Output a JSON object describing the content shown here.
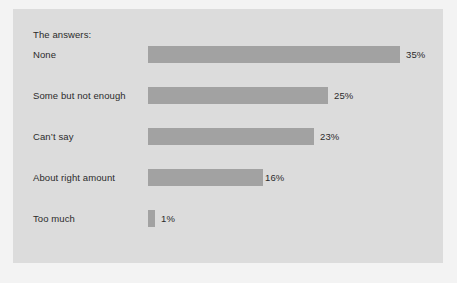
{
  "chart_data": {
    "type": "bar",
    "orientation": "horizontal",
    "title": "The answers:",
    "xlabel": "",
    "ylabel": "",
    "grid": false,
    "legend": null,
    "xlim": [
      0,
      35
    ],
    "value_suffix": "%",
    "categories": [
      "None",
      "Some but not enough",
      "Can’t say",
      "About right amount",
      "Too much"
    ],
    "values": [
      35,
      25,
      23,
      16,
      1
    ],
    "data_labels": [
      "35%",
      "25%",
      "23%",
      "16%",
      "1%"
    ],
    "bars": [
      {
        "label": "None",
        "value": 35,
        "data_label": "35%"
      },
      {
        "label": "Some but not enough",
        "value": 25,
        "data_label": "25%"
      },
      {
        "label": "Can’t say",
        "value": 23,
        "data_label": "23%"
      },
      {
        "label": "About right amount",
        "value": 16,
        "data_label": "16%"
      },
      {
        "label": "Too much",
        "value": 1,
        "data_label": "1%"
      }
    ]
  },
  "style": {
    "panel_background": "#dcdcdc",
    "figure_background": "#f3f3f3",
    "bar_color": "#a2a2a2",
    "text_color": "#2b2b2b",
    "pixels_per_percent": 7.2,
    "row_pitch": 41,
    "first_row_top": 34,
    "bar_origin_x": 135
  }
}
